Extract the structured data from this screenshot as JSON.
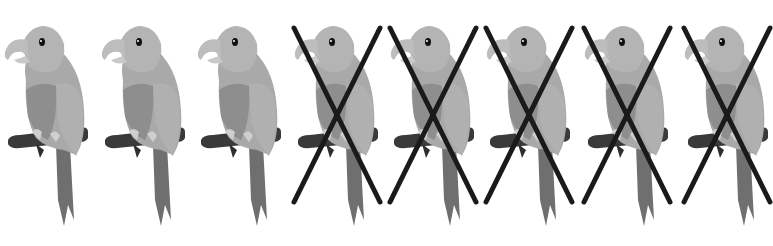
{
  "worksheet": {
    "subject": "parrot",
    "total_count": 8,
    "crossed_out_count": 5,
    "remaining_count": 3,
    "colors": {
      "background": "#ffffff",
      "body": "#a9a9a9",
      "chest": "#8e8e8e",
      "head": "#b4b4b4",
      "beak": "#bdbdbd",
      "perch": "#3a3a3a",
      "tail": "#6f6f6f",
      "x_mark": "#1a1a1a"
    },
    "birds": [
      {
        "index": 1,
        "x": 0,
        "crossed": false
      },
      {
        "index": 2,
        "x": 97,
        "crossed": false
      },
      {
        "index": 3,
        "x": 193,
        "crossed": false
      },
      {
        "index": 4,
        "x": 290,
        "crossed": true
      },
      {
        "index": 5,
        "x": 386,
        "crossed": true
      },
      {
        "index": 6,
        "x": 482,
        "crossed": true
      },
      {
        "index": 7,
        "x": 580,
        "crossed": true
      },
      {
        "index": 8,
        "x": 680,
        "crossed": true
      }
    ]
  }
}
